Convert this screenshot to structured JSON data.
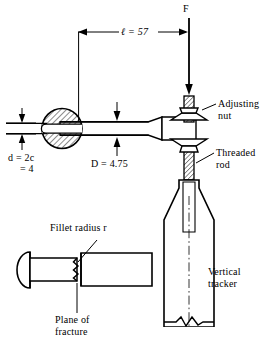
{
  "figure": {
    "background_color": "#ffffff",
    "line_color": "#000000",
    "width": 275,
    "height": 348
  },
  "labels": {
    "force": "F",
    "length_dimension": "ℓ = 57",
    "small_diameter_line1": "d = 2c",
    "small_diameter_line2": "= 4",
    "large_diameter": "D = 4.75",
    "adjusting_nut_line1": "Adjusting",
    "adjusting_nut_line2": "nut",
    "threaded_rod_line1": "Threaded",
    "threaded_rod_line2": "rod",
    "fillet_radius": "Fillet radius r",
    "plane_of_fracture_line1": "Plane of",
    "plane_of_fracture_line2": "fracture",
    "vertical_tracker_line1": "Vertical",
    "vertical_tracker_line2": "tracker"
  },
  "icons": {
    "force_arrow": "down-arrow-icon",
    "dimension_arrow_left": "left-arrow-icon",
    "dimension_arrow_right": "right-arrow-icon",
    "diameter_arrow_down": "down-arrow-icon",
    "diameter_arrow_up": "up-arrow-icon",
    "leader_line": "leader-line-icon",
    "break_line": "break-line-icon",
    "centerline": "center-line-icon",
    "hatching": "section-hatch-icon"
  },
  "geometry": {
    "length_value": 57,
    "small_diameter_value": 4,
    "large_diameter_value": 4.75,
    "units": "mm"
  }
}
